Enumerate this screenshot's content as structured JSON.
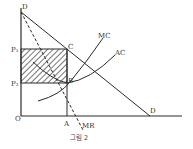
{
  "figure": {
    "caption": "그림 2",
    "type": "monopoly profit diagram"
  },
  "labels": {
    "origin": "O",
    "demand_top": "D",
    "demand_bottom": "D",
    "price_p1": "P₁",
    "price_p2": "P₂",
    "point_c": "C",
    "point_b": "B",
    "quantity_a": "A",
    "mc": "MC",
    "ac": "AC",
    "mr": "MR"
  },
  "colors": {
    "line": "#2a2a2a",
    "background": "#ffffff"
  }
}
